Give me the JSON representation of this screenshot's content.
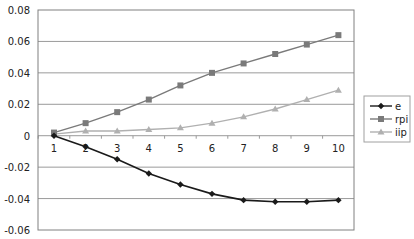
{
  "chart_data": {
    "type": "line",
    "title": "",
    "xlabel": "",
    "ylabel": "",
    "x": [
      1,
      2,
      3,
      4,
      5,
      6,
      7,
      8,
      9,
      10
    ],
    "categories": [
      "1",
      "2",
      "3",
      "4",
      "5",
      "6",
      "7",
      "8",
      "9",
      "10"
    ],
    "ylim": [
      -0.06,
      0.08
    ],
    "yticks": [
      0.08,
      0.06,
      0.04,
      0.02,
      0,
      -0.02,
      -0.04,
      -0.06
    ],
    "ytick_labels": [
      "0.08",
      "0.06",
      "0.04",
      "0.02",
      "0",
      "-0.02",
      "-0.04",
      "-0.06"
    ],
    "grid": true,
    "legend_position": "right",
    "series": [
      {
        "name": "e",
        "color": "#1a1a1a",
        "marker": "diamond",
        "values": [
          0.0,
          -0.007,
          -0.015,
          -0.024,
          -0.031,
          -0.037,
          -0.041,
          -0.042,
          -0.042,
          -0.041
        ]
      },
      {
        "name": "rpi",
        "color": "#7a7a7a",
        "marker": "square",
        "values": [
          0.002,
          0.008,
          0.015,
          0.023,
          0.032,
          0.04,
          0.046,
          0.052,
          0.058,
          0.064
        ]
      },
      {
        "name": "iip",
        "color": "#b0b0b0",
        "marker": "triangle",
        "values": [
          0.001,
          0.003,
          0.003,
          0.004,
          0.005,
          0.008,
          0.012,
          0.017,
          0.023,
          0.029
        ]
      }
    ]
  },
  "layout": {
    "plot_left": 38,
    "plot_right": 354,
    "plot_top": 10,
    "plot_bottom": 230,
    "x_first": 54,
    "x_step": 31.6
  }
}
